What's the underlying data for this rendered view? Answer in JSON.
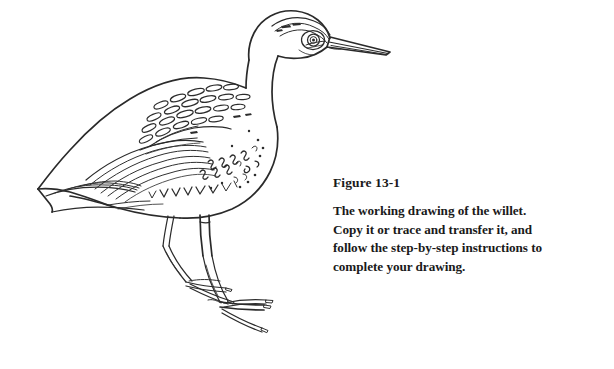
{
  "page": {
    "background_color": "#ffffff",
    "ink_color": "#2a2a2a"
  },
  "figure": {
    "heading": "Figure 13-1",
    "caption_lines": [
      "The working drawing of the willet.",
      "Copy it or trace and transfer it, and",
      "follow the step-by-step instructions to",
      "complete your drawing."
    ],
    "caption_full": "The working drawing of the willet. Copy it or trace and transfer it, and follow the step-by-step instructions to complete your drawing.",
    "illustration": {
      "subject": "willet",
      "subject_type": "shorebird",
      "style": "line drawing",
      "orientation": "facing right",
      "parts": [
        "beak",
        "eye",
        "crown-stripes",
        "head",
        "neck",
        "breast",
        "back",
        "scapular-feathers",
        "wing",
        "primary-feathers",
        "tail",
        "belly",
        "legs",
        "feet"
      ]
    }
  }
}
